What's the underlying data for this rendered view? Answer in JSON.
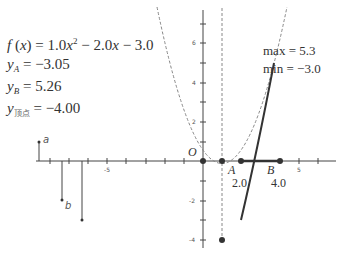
{
  "formula": {
    "fx_prefix": "f (x) = ",
    "coef_a": "1.0",
    "term_b": " − 2.0",
    "term_c": " − 3.0",
    "yA_label": "y",
    "yA_sub": "A",
    "yA_value": " = −3.05",
    "yB_label": "y",
    "yB_sub": "B",
    "yB_value": " = 5.26",
    "yV_label": "y",
    "yV_sub": "顶点",
    "yV_value": " = −4.00"
  },
  "range": {
    "max": "max = 5.3",
    "min": "min = −3.0"
  },
  "points": {
    "origin": "O",
    "A": "A",
    "B": "B",
    "a_val": "2.0",
    "b_val": "4.0"
  },
  "stems": {
    "a": "a",
    "b": "b"
  },
  "ticks": {
    "y6": "6",
    "y4": "4",
    "y2": "2",
    "yn2": "-2",
    "yn4": "-4",
    "xn5": "-5",
    "x5": "5"
  },
  "colors": {
    "axis": "#444444",
    "curve": "#333333",
    "dashed": "#888888",
    "point": "#333333"
  }
}
